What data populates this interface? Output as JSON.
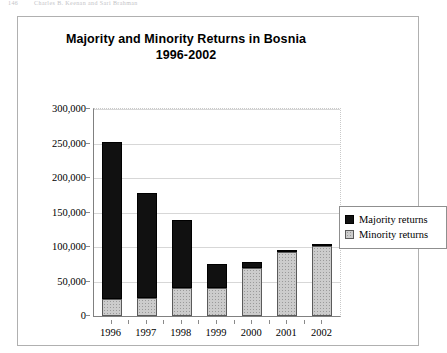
{
  "page": {
    "running_head_folio": "146",
    "running_head_text": "Charles B. Keenan and Sari Brahman"
  },
  "chart_data": {
    "type": "bar",
    "subtype": "stacked-column",
    "title": "Majority and Minority Returns in Bosnia",
    "subtitle": "1996-2002",
    "xlabel": "",
    "ylabel": "",
    "categories": [
      "1996",
      "1997",
      "1998",
      "1999",
      "2000",
      "2001",
      "2002"
    ],
    "series": [
      {
        "name": "Minority returns",
        "color": "#cccccc",
        "values": [
          24000,
          26000,
          41000,
          41000,
          70000,
          93000,
          101000
        ]
      },
      {
        "name": "Majority returns",
        "color": "#111111",
        "values": [
          228000,
          152000,
          98000,
          34000,
          8000,
          3000,
          4000
        ]
      }
    ],
    "totals": [
      252000,
      178000,
      139000,
      75000,
      78000,
      96000,
      105000
    ],
    "ylim": [
      0,
      300000
    ],
    "ytick_values": [
      0,
      50000,
      100000,
      150000,
      200000,
      250000,
      300000
    ],
    "ytick_labels": [
      "0",
      "50,000",
      "100,000",
      "150,000",
      "200,000",
      "250,000",
      "300,000"
    ],
    "grid": true,
    "legend_position": "right",
    "legend_entries": [
      {
        "label": "Majority returns",
        "swatch": "majority"
      },
      {
        "label": "Minority returns",
        "swatch": "minority"
      }
    ]
  }
}
